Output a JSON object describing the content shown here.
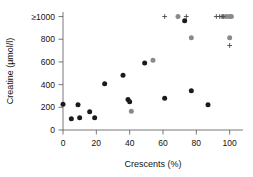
{
  "chart_data": {
    "type": "scatter",
    "title": "",
    "xlabel": "Crescents (%)",
    "ylabel": "Creatine (µmol/l)",
    "xlim": [
      0,
      108
    ],
    "ylim": [
      0,
      1040
    ],
    "xticks": [
      0,
      20,
      40,
      60,
      80,
      100
    ],
    "xticklabels": [
      "0",
      "20",
      "40",
      "60",
      "80",
      "100"
    ],
    "yticks": [
      0,
      200,
      400,
      600,
      800,
      1000
    ],
    "yticklabels": [
      "0",
      "200",
      "400",
      "600",
      "800",
      "≥1000"
    ],
    "grid": false,
    "legend": "none",
    "series": [
      {
        "name": "black-circle",
        "marker": "filled-circle",
        "color": "#1b1b1b",
        "points": [
          [
            0,
            228
          ],
          [
            5,
            100
          ],
          [
            9,
            222
          ],
          [
            10,
            108
          ],
          [
            16,
            160
          ],
          [
            19,
            108
          ],
          [
            25,
            408
          ],
          [
            36,
            483
          ],
          [
            39,
            268
          ],
          [
            40,
            248
          ],
          [
            49,
            590
          ],
          [
            61,
            280
          ],
          [
            73,
            963
          ],
          [
            77,
            347
          ],
          [
            87,
            222
          ]
        ]
      },
      {
        "name": "gray-circle",
        "marker": "filled-circle",
        "color": "#8a8a8a",
        "points": [
          [
            41,
            165
          ],
          [
            54,
            615
          ],
          [
            69,
            1000
          ],
          [
            77,
            812
          ],
          [
            96,
            1000
          ],
          [
            98,
            1000
          ],
          [
            100,
            1000
          ],
          [
            101,
            1000
          ],
          [
            100,
            812
          ]
        ]
      },
      {
        "name": "cross",
        "marker": "plus",
        "color": "#4a4a4a",
        "points": [
          [
            61,
            1000
          ],
          [
            74,
            1000
          ],
          [
            92,
            1000
          ],
          [
            94,
            1000
          ],
          [
            96,
            1000
          ],
          [
            100,
            745
          ]
        ]
      }
    ]
  }
}
